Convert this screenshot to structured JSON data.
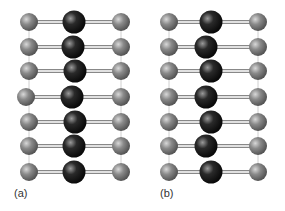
{
  "panels": [
    {
      "label": "(a)",
      "description": "Aligned chain: outer atoms straight, central atoms in a straight column",
      "rows": 7,
      "offsets": [
        0,
        -1,
        1,
        -2,
        1,
        0,
        0
      ]
    },
    {
      "label": "(b)",
      "description": "Zig-zag chain: central atoms alternately displaced",
      "rows": 7,
      "offsets": [
        2,
        -3,
        2,
        -3,
        2,
        -3,
        2
      ]
    }
  ],
  "colors": {
    "outer_atom": "#7a7a7a",
    "central_atom": "#1e1e1e",
    "bond": "#888888",
    "vertical_link": "#d0d0d0"
  }
}
